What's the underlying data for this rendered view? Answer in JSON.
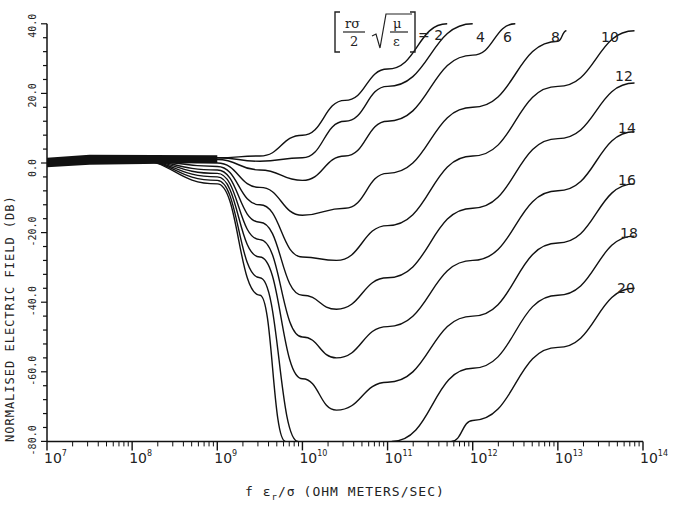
{
  "chart_data": {
    "type": "line",
    "title": "",
    "xlabel": "f ε_r/σ (OHM METERS/SEC)",
    "ylabel": "NORMALISED ELECTRIC FIELD (DB)",
    "xscale": "log",
    "xlim": [
      10000000.0,
      100000000000000.0
    ],
    "ylim": [
      -80,
      40
    ],
    "x_ticks": [
      "10^7",
      "10^8",
      "10^9",
      "10^10",
      "10^11",
      "10^12",
      "10^13",
      "10^14"
    ],
    "y_ticks": [
      "-80.0",
      "-60.0",
      "-40.0",
      "-20.0",
      "0.0",
      "20.0",
      "40.0"
    ],
    "grid": false,
    "legend_formula": "[ rσ/2 √(μ/ε) ] = 2",
    "parameter_name": "rσ/2 √(μ/ε)",
    "series": [
      {
        "name": "2",
        "points": [
          [
            7,
            0
          ],
          [
            8,
            1
          ],
          [
            9,
            1.5
          ],
          [
            9.5,
            2
          ],
          [
            10,
            8
          ],
          [
            10.5,
            18
          ],
          [
            11,
            27
          ],
          [
            11.7,
            40
          ]
        ]
      },
      {
        "name": "4",
        "points": [
          [
            7,
            0
          ],
          [
            8,
            1
          ],
          [
            9,
            1.5
          ],
          [
            9.5,
            0.5
          ],
          [
            10,
            1.5
          ],
          [
            10.5,
            12
          ],
          [
            11,
            22
          ],
          [
            12,
            40
          ]
        ]
      },
      {
        "name": "6",
        "points": [
          [
            7,
            0
          ],
          [
            8,
            1
          ],
          [
            9,
            1
          ],
          [
            9.5,
            -2
          ],
          [
            10,
            -5
          ],
          [
            10.5,
            2
          ],
          [
            11,
            12
          ],
          [
            12,
            31
          ],
          [
            12.5,
            40
          ]
        ]
      },
      {
        "name": "8",
        "points": [
          [
            7,
            0
          ],
          [
            8,
            1
          ],
          [
            9,
            0
          ],
          [
            9.5,
            -7
          ],
          [
            10,
            -15
          ],
          [
            10.5,
            -13
          ],
          [
            11,
            -3
          ],
          [
            12,
            16
          ],
          [
            13,
            35
          ],
          [
            13.1,
            38
          ]
        ]
      },
      {
        "name": "10",
        "points": [
          [
            7,
            0
          ],
          [
            8,
            1
          ],
          [
            9,
            -1
          ],
          [
            9.5,
            -12
          ],
          [
            10,
            -27
          ],
          [
            10.4,
            -28
          ],
          [
            11,
            -18
          ],
          [
            12,
            2
          ],
          [
            13,
            22
          ],
          [
            13.9,
            38
          ]
        ]
      },
      {
        "name": "12",
        "points": [
          [
            7,
            0
          ],
          [
            8,
            1
          ],
          [
            9,
            -2
          ],
          [
            9.5,
            -17
          ],
          [
            10,
            -38
          ],
          [
            10.4,
            -42
          ],
          [
            11,
            -33
          ],
          [
            12,
            -13
          ],
          [
            13,
            7
          ],
          [
            13.9,
            23
          ]
        ]
      },
      {
        "name": "14",
        "points": [
          [
            7,
            0
          ],
          [
            8,
            1
          ],
          [
            9,
            -3
          ],
          [
            9.5,
            -22
          ],
          [
            10,
            -50
          ],
          [
            10.4,
            -56
          ],
          [
            11,
            -47
          ],
          [
            12,
            -28
          ],
          [
            13,
            -8
          ],
          [
            13.9,
            9
          ]
        ]
      },
      {
        "name": "16",
        "points": [
          [
            7,
            0
          ],
          [
            8,
            1
          ],
          [
            9,
            -4
          ],
          [
            9.5,
            -27
          ],
          [
            10,
            -62
          ],
          [
            10.4,
            -71
          ],
          [
            11,
            -63
          ],
          [
            12,
            -44
          ],
          [
            13,
            -23
          ],
          [
            13.9,
            -6
          ]
        ]
      },
      {
        "name": "18",
        "points": [
          [
            7,
            0
          ],
          [
            8,
            1
          ],
          [
            9,
            -5
          ],
          [
            9.5,
            -33
          ],
          [
            9.95,
            -80
          ],
          null,
          [
            11.05,
            -80
          ],
          [
            12,
            -59
          ],
          [
            13,
            -38
          ],
          [
            13.9,
            -21
          ]
        ]
      },
      {
        "name": "20",
        "points": [
          [
            7,
            0
          ],
          [
            8,
            1
          ],
          [
            9,
            -6
          ],
          [
            9.5,
            -38
          ],
          [
            9.8,
            -80
          ],
          null,
          [
            11.75,
            -80
          ],
          [
            12,
            -74
          ],
          [
            13,
            -53
          ],
          [
            13.9,
            -36
          ]
        ]
      }
    ]
  },
  "axes": {
    "x_labels": [
      "10",
      "10",
      "10",
      "10",
      "10",
      "10",
      "10",
      "10"
    ],
    "x_exponents": [
      "7",
      "8",
      "9",
      "10",
      "11",
      "12",
      "13",
      "14"
    ],
    "y_labels": [
      "40.0",
      "20.0",
      "0.0",
      "-20.0",
      "-40.0",
      "-60.0",
      "-80.0"
    ],
    "x_title_prefix": "f ε",
    "x_title_sub": "r",
    "x_title_mid": "/σ",
    "x_title_suffix": "(OHM METERS/SEC)",
    "y_title": "NORMALISED ELECTRIC FIELD (DB)"
  },
  "legend": {
    "numerator": "rσ",
    "denominator": "2",
    "root_num": "μ",
    "root_den": "ε",
    "equals": "= 2"
  },
  "curve_labels": [
    "4",
    "6",
    "8",
    "10",
    "12",
    "14",
    "16",
    "18",
    "20"
  ]
}
